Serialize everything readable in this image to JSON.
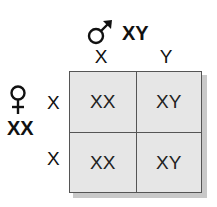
{
  "male": {
    "symbol": "male-symbol",
    "genotype": "XY",
    "alleles": [
      "X",
      "Y"
    ]
  },
  "female": {
    "symbol": "female-symbol",
    "genotype": "XX",
    "alleles": [
      "X",
      "X"
    ]
  },
  "punnett": {
    "cells": [
      [
        "XX",
        "XY"
      ],
      [
        "XX",
        "XY"
      ]
    ]
  },
  "colors": {
    "grid_fill": "#e6e6e6",
    "grid_border": "#555555",
    "shadow": "#c9c9c9"
  }
}
